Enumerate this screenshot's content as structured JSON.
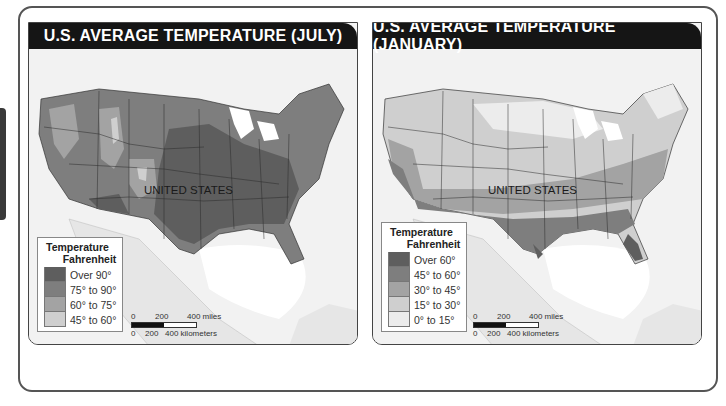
{
  "panels": [
    {
      "title": "U.S. AVERAGE TEMPERATURE (JULY)",
      "country_label": "UNITED STATES",
      "legend": {
        "title": "Temperature",
        "subtitle": "Fahrenheit",
        "items": [
          {
            "label": "Over 90°",
            "color": "#5e5e5e"
          },
          {
            "label": "75° to 90°",
            "color": "#7e7e7e"
          },
          {
            "label": "60° to 75°",
            "color": "#a3a3a3"
          },
          {
            "label": "45° to 60°",
            "color": "#cfcfcf"
          }
        ]
      },
      "scale": {
        "miles_ticks": [
          "0",
          "200",
          "400 miles"
        ],
        "km_ticks": [
          "0",
          "200",
          "400 kilometers"
        ]
      }
    },
    {
      "title": "U.S. AVERAGE TEMPERATURE (JANUARY)",
      "country_label": "UNITED STATES",
      "legend": {
        "title": "Temperature",
        "subtitle": "Fahrenheit",
        "items": [
          {
            "label": "Over 60°",
            "color": "#5e5e5e"
          },
          {
            "label": "45° to 60°",
            "color": "#7e7e7e"
          },
          {
            "label": "30° to 45°",
            "color": "#a3a3a3"
          },
          {
            "label": "15° to 30°",
            "color": "#cfcfcf"
          },
          {
            "label": "0° to 15°",
            "color": "#ececec"
          }
        ]
      },
      "scale": {
        "miles_ticks": [
          "0",
          "200",
          "400 miles"
        ],
        "km_ticks": [
          "0",
          "200",
          "400 kilometers"
        ]
      }
    }
  ]
}
